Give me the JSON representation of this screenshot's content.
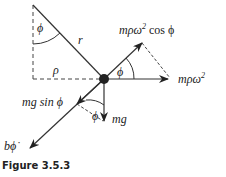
{
  "figure": {
    "caption": "Figure 3.5.3",
    "labels": {
      "phi_top": "ϕ",
      "r": "r",
      "rho": "ρ",
      "phi_right": "ϕ",
      "phi_bottom": "ϕ",
      "centripetal_component_prefix": "mρω",
      "centripetal_component_exp": "2",
      "centripetal_component_suffix": " cos ϕ",
      "centripetal_prefix": "mρω",
      "centripetal_exp": "2",
      "gravity_component": "mg sin ϕ",
      "gravity": "mg",
      "damping_prefix": "b",
      "damping_symbol": "ϕ̇"
    },
    "colors": {
      "line": "#333333",
      "ball": "#222222"
    }
  }
}
